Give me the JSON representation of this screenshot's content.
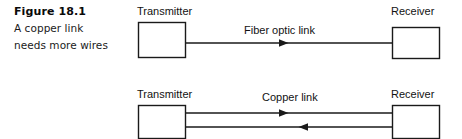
{
  "figure": {
    "caption": {
      "title": "Figure 18.1",
      "lines": [
        "A copper link",
        "needs more wires"
      ]
    },
    "colors": {
      "ink": "#111111",
      "background": "#ffffff",
      "line": "#1a1a1a"
    },
    "diagrams": [
      {
        "id": "fiber-optic-diagram",
        "link_label": "Fiber optic link",
        "source_label": "Transmitter",
        "target_label": "Receiver",
        "wire_count": 1,
        "directions": [
          "right"
        ]
      },
      {
        "id": "copper-diagram",
        "link_label": "Copper link",
        "source_label": "Transmitter",
        "target_label": "Receiver",
        "wire_count": 2,
        "directions": [
          "right",
          "left"
        ]
      }
    ]
  }
}
